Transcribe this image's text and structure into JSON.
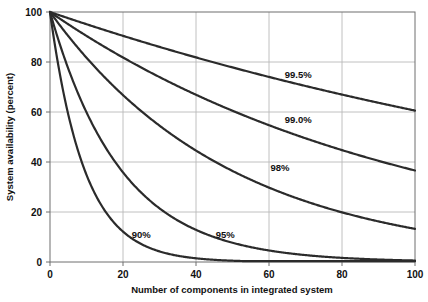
{
  "chart_data": {
    "type": "line",
    "title": "",
    "xlabel": "Number of components in integrated system",
    "ylabel": "System availability (percent)",
    "xlim": [
      0,
      100
    ],
    "ylim": [
      0,
      100
    ],
    "xticks": [
      0,
      20,
      40,
      60,
      80,
      100
    ],
    "yticks": [
      0,
      20,
      40,
      60,
      80,
      100
    ],
    "xtick_labels": [
      "0",
      "20",
      "40",
      "60",
      "80",
      "100"
    ],
    "ytick_labels": [
      "0",
      "20",
      "40",
      "60",
      "80",
      "100"
    ],
    "grid": true,
    "legend_position": "inline-annotations",
    "x": [
      0,
      5,
      10,
      15,
      20,
      25,
      30,
      35,
      40,
      45,
      50,
      55,
      60,
      65,
      70,
      75,
      80,
      85,
      90,
      95,
      100
    ],
    "series": [
      {
        "name": "99.5%",
        "label": "99.5%",
        "component_reliability": 0.995,
        "label_x": 68,
        "label_y": 75,
        "values": [
          100,
          97.5,
          95.1,
          92.8,
          90.5,
          88.2,
          86.0,
          83.9,
          81.8,
          79.8,
          77.8,
          75.9,
          74.0,
          72.2,
          70.4,
          68.6,
          66.9,
          65.3,
          63.6,
          62.1,
          60.6
        ]
      },
      {
        "name": "99.0%",
        "label": "99.0%",
        "component_reliability": 0.99,
        "label_x": 68,
        "label_y": 57,
        "values": [
          100,
          95.1,
          90.4,
          86.0,
          81.8,
          77.8,
          74.0,
          70.3,
          66.9,
          63.6,
          60.5,
          57.5,
          54.7,
          52.0,
          49.4,
          47.0,
          44.7,
          42.5,
          40.4,
          38.4,
          36.6
        ]
      },
      {
        "name": "98%",
        "label": "98%",
        "component_reliability": 0.98,
        "label_x": 63,
        "label_y": 38,
        "values": [
          100,
          90.4,
          81.7,
          73.9,
          66.8,
          60.3,
          54.5,
          49.3,
          44.6,
          40.3,
          36.4,
          32.9,
          29.8,
          26.9,
          24.3,
          22.0,
          19.9,
          18.0,
          16.3,
          14.7,
          13.3
        ]
      },
      {
        "name": "95%",
        "label": "95%",
        "component_reliability": 0.95,
        "label_x": 48,
        "label_y": 11,
        "values": [
          100,
          77.4,
          59.9,
          46.3,
          35.8,
          27.7,
          21.5,
          16.6,
          12.9,
          9.9,
          7.7,
          6.0,
          4.6,
          3.6,
          2.8,
          2.1,
          1.7,
          1.3,
          1.0,
          0.8,
          0.6
        ]
      },
      {
        "name": "90%",
        "label": "90%",
        "component_reliability": 0.9,
        "label_x": 25,
        "label_y": 11,
        "values": [
          100,
          59.0,
          34.9,
          20.6,
          12.2,
          7.2,
          4.2,
          2.5,
          1.5,
          0.9,
          0.5,
          0.3,
          0.2,
          0.1,
          0.1,
          0.0,
          0.0,
          0.0,
          0.0,
          0.0,
          0.0
        ]
      }
    ],
    "colors": {
      "curve": "#2b2b2b",
      "grid": "#b9b9b9",
      "axis": "#6e6e6e",
      "text": "#111111",
      "background": "#ffffff"
    }
  }
}
